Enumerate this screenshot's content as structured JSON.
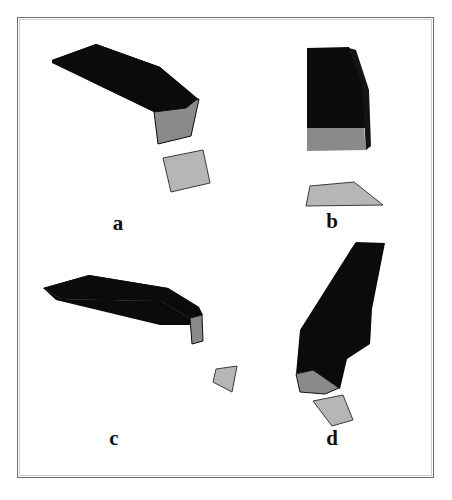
{
  "figure": {
    "width": 452,
    "height": 500,
    "background": "#ffffff",
    "border_color": "#6e6e6e",
    "plate": {
      "x": 17,
      "y": 17,
      "width": 417,
      "height": 461
    }
  },
  "palette": {
    "black_face": "#0b0b0b",
    "dark_face": "#141414",
    "mid_gray_face": "#8a8a8a",
    "light_gray_fragment": "#b6b6b6",
    "edge_stroke": "#101010",
    "paper": "#ffffff"
  },
  "labels": {
    "a": "a",
    "b": "b",
    "c": "c",
    "d": "d"
  },
  "scan_tail_text": "",
  "panels": [
    {
      "id": "a",
      "label": "a",
      "label_position": {
        "x": 103,
        "y": 213
      },
      "description": "Curved bent beam seen from above-left, dark top faces with a mid-gray end cap and a detached light-gray quadrilateral fragment below-right.",
      "parts": [
        {
          "name": "beam-top-near",
          "fill": "#0b0b0b",
          "points": "52,60 96,44 160,67 148,86 128,93"
        },
        {
          "name": "beam-top-far",
          "fill": "#111111",
          "points": "96,44 160,67 197,98 186,108 160,93"
        },
        {
          "name": "beam-side",
          "fill": "#0b0b0b",
          "points": "52,60 128,93 160,93 186,108 186,112 154,112 96,84"
        },
        {
          "name": "beam-end-cap",
          "fill": "#8a8a8a",
          "points": "154,112 186,108 196,100 199,99 191,136 158,144"
        },
        {
          "name": "fragment",
          "fill": "#b6b6b6",
          "points": "163,158 203,150 210,183 171,192"
        }
      ]
    },
    {
      "id": "b",
      "label": "b",
      "label_position": {
        "x": 317,
        "y": 211
      },
      "description": "Upright block, black front face narrowing to the right, mid-gray lower band, and a separate light-gray trapezoid fragment below.",
      "parts": [
        {
          "name": "block-front-upper",
          "fill": "#0b0b0b",
          "points": "307,48 349,48 362,85 363,122 307,122"
        },
        {
          "name": "block-front-lower",
          "fill": "#0b0b0b",
          "points": "307,122 363,122 364,128 307,128"
        },
        {
          "name": "block-side-gray",
          "fill": "#8a8a8a",
          "points": "307,128 364,128 366,150 307,151"
        },
        {
          "name": "block-bevel",
          "fill": "#141414",
          "points": "349,48 362,85 366,150 371,146 369,90 356,50"
        },
        {
          "name": "fragment",
          "fill": "#b6b6b6",
          "points": "310,186 354,182 383,205 306,206"
        }
      ]
    },
    {
      "id": "c",
      "label": "c",
      "label_position": {
        "x": 99,
        "y": 428
      },
      "description": "Long flat bent bar seen nearly edge-on, black faces with a narrow mid-gray end cap at the right and a small light-gray fragment below it.",
      "parts": [
        {
          "name": "bar-top-left",
          "fill": "#0b0b0b",
          "points": "43,288 89,275 168,288 161,301 62,299"
        },
        {
          "name": "bar-top-right",
          "fill": "#111111",
          "points": "168,288 199,307 202,315 190,318 161,301"
        },
        {
          "name": "bar-side",
          "fill": "#0b0b0b",
          "points": "43,288 62,299 161,301 190,318 190,325 160,325 56,300"
        },
        {
          "name": "bar-end-cap",
          "fill": "#8a8a8a",
          "points": "190,318 202,315 203,341 192,344"
        },
        {
          "name": "fragment",
          "fill": "#b6b6b6",
          "points": "216,369 237,366 232,392 213,382"
        }
      ]
    },
    {
      "id": "d",
      "label": "d",
      "label_position": {
        "x": 317,
        "y": 428
      },
      "description": "Tall bent beam leaning right, black faces with a mid-gray slanted foot cap at the bottom-left and a detached light-gray quadrilateral fragment below.",
      "parts": [
        {
          "name": "beam-upper",
          "fill": "#0b0b0b",
          "points": "355,243 384,243 371,310 336,330 320,326"
        },
        {
          "name": "beam-lower",
          "fill": "#111111",
          "points": "336,330 371,310 370,343 346,358 307,356"
        },
        {
          "name": "beam-left",
          "fill": "#0b0b0b",
          "points": "355,243 320,326 307,356 300,372 296,374 300,330"
        },
        {
          "name": "beam-foot-gray",
          "fill": "#8a8a8a",
          "points": "296,374 313,370 339,388 325,394 300,392"
        },
        {
          "name": "beam-foot-dark",
          "fill": "#141414",
          "points": "307,356 346,358 339,388 313,370"
        },
        {
          "name": "fragment",
          "fill": "#b6b6b6",
          "points": "313,401 343,395 353,420 332,426"
        }
      ]
    }
  ]
}
